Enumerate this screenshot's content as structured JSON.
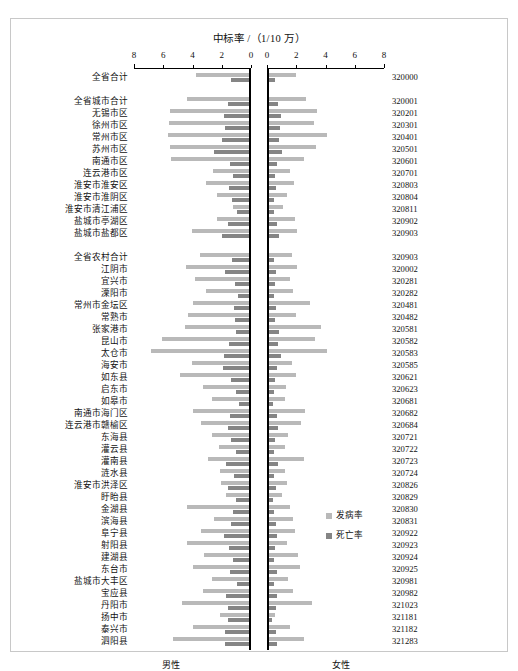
{
  "figure": {
    "axis_title": "中标率 /（1/10 万）",
    "left_group_label": "男性",
    "right_group_label": "女性"
  },
  "legend": {
    "position": "bottom-right",
    "items": [
      {
        "label": "发病率",
        "color": "#b9b9b9"
      },
      {
        "label": "死亡率",
        "color": "#858585"
      }
    ]
  },
  "axis": {
    "left_ticks": [
      "8",
      "6",
      "4",
      "2",
      "0"
    ],
    "right_ticks": [
      "0",
      "2",
      "4",
      "6",
      "8"
    ],
    "min": 0,
    "max": 8
  },
  "colors": {
    "incidence": "#b9b9b9",
    "mortality": "#858585",
    "frame": "#c8c8c8",
    "axis": "#000000"
  },
  "chart_data": {
    "type": "bar",
    "orientation": "horizontal-diverging",
    "title": "中标率 /（1/10 万）",
    "xlabel": "中标率 /（1/10 万）",
    "ylabel": "",
    "xlim": [
      0,
      8
    ],
    "grid": false,
    "legend_position": "bottom-right",
    "panels": [
      {
        "name": "男性",
        "side": "left",
        "direction": "right-to-left"
      },
      {
        "name": "女性",
        "side": "right",
        "direction": "left-to-right"
      }
    ],
    "series": [
      {
        "name": "发病率",
        "color": "#b9b9b9"
      },
      {
        "name": "死亡率",
        "color": "#858585"
      }
    ],
    "sections": [
      {
        "name": "总计",
        "rows": [
          {
            "label": "全省合计",
            "code": "320000",
            "male_incidence": 3.75,
            "male_mortality": 1.35,
            "female_incidence": 1.95,
            "female_mortality": 0.55
          }
        ]
      },
      {
        "name": "城市",
        "rows": [
          {
            "label": "全省城市合计",
            "code": "320001",
            "male_incidence": 4.35,
            "male_mortality": 1.55,
            "female_incidence": 2.65,
            "female_mortality": 0.75
          },
          {
            "label": "无锡市区",
            "code": "320201",
            "male_incidence": 5.55,
            "male_mortality": 1.85,
            "female_incidence": 3.45,
            "female_mortality": 0.95
          },
          {
            "label": "徐州市区",
            "code": "320301",
            "male_incidence": 5.6,
            "male_mortality": 1.8,
            "female_incidence": 3.2,
            "female_mortality": 0.9
          },
          {
            "label": "常州市区",
            "code": "320401",
            "male_incidence": 5.7,
            "male_mortality": 2.0,
            "female_incidence": 4.1,
            "female_mortality": 0.85
          },
          {
            "label": "苏州市区",
            "code": "320501",
            "male_incidence": 5.55,
            "male_mortality": 2.55,
            "female_incidence": 3.35,
            "female_mortality": 1.0
          },
          {
            "label": "南通市区",
            "code": "320601",
            "male_incidence": 5.5,
            "male_mortality": 1.45,
            "female_incidence": 2.55,
            "female_mortality": 0.7
          },
          {
            "label": "连云港市区",
            "code": "320701",
            "male_incidence": 2.6,
            "male_mortality": 1.2,
            "female_incidence": 1.6,
            "female_mortality": 0.55
          },
          {
            "label": "淮安市淮安区",
            "code": "320803",
            "male_incidence": 3.05,
            "male_mortality": 1.5,
            "female_incidence": 1.85,
            "female_mortality": 0.6
          },
          {
            "label": "淮安市淮阴区",
            "code": "320804",
            "male_incidence": 2.35,
            "male_mortality": 1.3,
            "female_incidence": 1.35,
            "female_mortality": 0.5
          },
          {
            "label": "淮安市清江浦区",
            "code": "320811",
            "male_incidence": 1.25,
            "male_mortality": 0.95,
            "female_incidence": 1.1,
            "female_mortality": 0.45
          },
          {
            "label": "盐城市亭湖区",
            "code": "320902",
            "male_incidence": 2.3,
            "male_mortality": 1.6,
            "female_incidence": 1.9,
            "female_mortality": 0.65
          },
          {
            "label": "盐城市盐都区",
            "code": "320903",
            "male_incidence": 4.05,
            "male_mortality": 1.95,
            "female_incidence": 2.05,
            "female_mortality": 0.8
          }
        ]
      },
      {
        "name": "农村",
        "rows": [
          {
            "label": "全省农村合计",
            "code": "320903",
            "male_incidence": 3.5,
            "male_mortality": 1.3,
            "female_incidence": 1.7,
            "female_mortality": 0.5
          },
          {
            "label": "江阴市",
            "code": "320002",
            "male_incidence": 4.45,
            "male_mortality": 1.75,
            "female_incidence": 2.05,
            "female_mortality": 0.6
          },
          {
            "label": "宜兴市",
            "code": "320281",
            "male_incidence": 3.8,
            "male_mortality": 1.1,
            "female_incidence": 1.6,
            "female_mortality": 0.55
          },
          {
            "label": "溧阳市",
            "code": "320282",
            "male_incidence": 3.05,
            "male_mortality": 0.9,
            "female_incidence": 1.75,
            "female_mortality": 0.5
          },
          {
            "label": "常州市金坛区",
            "code": "320481",
            "male_incidence": 3.95,
            "male_mortality": 1.15,
            "female_incidence": 2.95,
            "female_mortality": 0.6
          },
          {
            "label": "常熟市",
            "code": "320482",
            "male_incidence": 4.3,
            "male_mortality": 1.1,
            "female_incidence": 2.0,
            "female_mortality": 0.55
          },
          {
            "label": "张家港市",
            "code": "320581",
            "male_incidence": 4.5,
            "male_mortality": 1.05,
            "female_incidence": 3.7,
            "female_mortality": 0.8
          },
          {
            "label": "昆山市",
            "code": "320582",
            "male_incidence": 6.1,
            "male_mortality": 1.5,
            "female_incidence": 3.3,
            "female_mortality": 0.75
          },
          {
            "label": "太仓市",
            "code": "320583",
            "male_incidence": 6.85,
            "male_mortality": 1.85,
            "female_incidence": 4.1,
            "female_mortality": 0.95
          },
          {
            "label": "海安市",
            "code": "320585",
            "male_incidence": 4.05,
            "male_mortality": 1.9,
            "female_incidence": 1.7,
            "female_mortality": 0.65
          },
          {
            "label": "如东县",
            "code": "320621",
            "male_incidence": 4.85,
            "male_mortality": 1.35,
            "female_incidence": 1.95,
            "female_mortality": 0.55
          },
          {
            "label": "启东市",
            "code": "320623",
            "male_incidence": 3.25,
            "male_mortality": 1.0,
            "female_incidence": 1.3,
            "female_mortality": 0.45
          },
          {
            "label": "如皋市",
            "code": "320681",
            "male_incidence": 2.65,
            "male_mortality": 0.85,
            "female_incidence": 1.2,
            "female_mortality": 0.4
          },
          {
            "label": "南通市海门区",
            "code": "320682",
            "male_incidence": 3.95,
            "male_mortality": 1.45,
            "female_incidence": 2.6,
            "female_mortality": 0.7
          },
          {
            "label": "连云港市赣榆区",
            "code": "320684",
            "male_incidence": 3.45,
            "male_mortality": 1.6,
            "female_incidence": 2.35,
            "female_mortality": 0.75
          },
          {
            "label": "东海县",
            "code": "320721",
            "male_incidence": 2.7,
            "male_mortality": 1.4,
            "female_incidence": 1.45,
            "female_mortality": 0.55
          },
          {
            "label": "灌云县",
            "code": "320722",
            "male_incidence": 2.2,
            "male_mortality": 1.05,
            "female_incidence": 1.25,
            "female_mortality": 0.5
          },
          {
            "label": "灌南县",
            "code": "320723",
            "male_incidence": 2.95,
            "male_mortality": 1.7,
            "female_incidence": 2.55,
            "female_mortality": 0.75
          },
          {
            "label": "涟水县",
            "code": "320724",
            "male_incidence": 2.15,
            "male_mortality": 1.15,
            "female_incidence": 1.25,
            "female_mortality": 0.45
          },
          {
            "label": "淮安市洪泽区",
            "code": "320826",
            "male_incidence": 2.05,
            "male_mortality": 1.55,
            "female_incidence": 1.35,
            "female_mortality": 0.6
          },
          {
            "label": "盱眙县",
            "code": "320829",
            "male_incidence": 1.7,
            "male_mortality": 1.05,
            "female_incidence": 1.05,
            "female_mortality": 0.4
          },
          {
            "label": "金湖县",
            "code": "320830",
            "male_incidence": 4.35,
            "male_mortality": 1.2,
            "female_incidence": 1.55,
            "female_mortality": 0.45
          },
          {
            "label": "滨海县",
            "code": "320831",
            "male_incidence": 2.5,
            "male_mortality": 1.35,
            "female_incidence": 1.75,
            "female_mortality": 0.6
          },
          {
            "label": "阜宁县",
            "code": "320922",
            "male_incidence": 3.4,
            "male_mortality": 1.85,
            "female_incidence": 1.9,
            "female_mortality": 0.7
          },
          {
            "label": "射阳县",
            "code": "320923",
            "male_incidence": 4.35,
            "male_mortality": 1.5,
            "female_incidence": 1.4,
            "female_mortality": 0.55
          },
          {
            "label": "建湖县",
            "code": "320924",
            "male_incidence": 3.2,
            "male_mortality": 1.25,
            "female_incidence": 2.15,
            "female_mortality": 0.5
          },
          {
            "label": "东台市",
            "code": "320925",
            "male_incidence": 3.95,
            "male_mortality": 1.45,
            "female_incidence": 2.25,
            "female_mortality": 0.65
          },
          {
            "label": "盐城市大丰区",
            "code": "320981",
            "male_incidence": 2.7,
            "male_mortality": 0.95,
            "female_incidence": 1.45,
            "female_mortality": 0.5
          },
          {
            "label": "宝应县",
            "code": "320982",
            "male_incidence": 3.25,
            "male_mortality": 1.7,
            "female_incidence": 1.8,
            "female_mortality": 0.7
          },
          {
            "label": "丹阳市",
            "code": "321023",
            "male_incidence": 4.7,
            "male_mortality": 1.55,
            "female_incidence": 3.05,
            "female_mortality": 0.6
          },
          {
            "label": "扬中市",
            "code": "321181",
            "male_incidence": 2.15,
            "male_mortality": 1.6,
            "female_incidence": 0.55,
            "female_mortality": 0.35
          },
          {
            "label": "泰兴市",
            "code": "321182",
            "male_incidence": 4.0,
            "male_mortality": 1.8,
            "female_incidence": 1.55,
            "female_mortality": 0.6
          },
          {
            "label": "泗阳县",
            "code": "321283",
            "male_incidence": 5.35,
            "male_mortality": 1.75,
            "female_incidence": 2.5,
            "female_mortality": 0.7
          }
        ]
      }
    ]
  }
}
